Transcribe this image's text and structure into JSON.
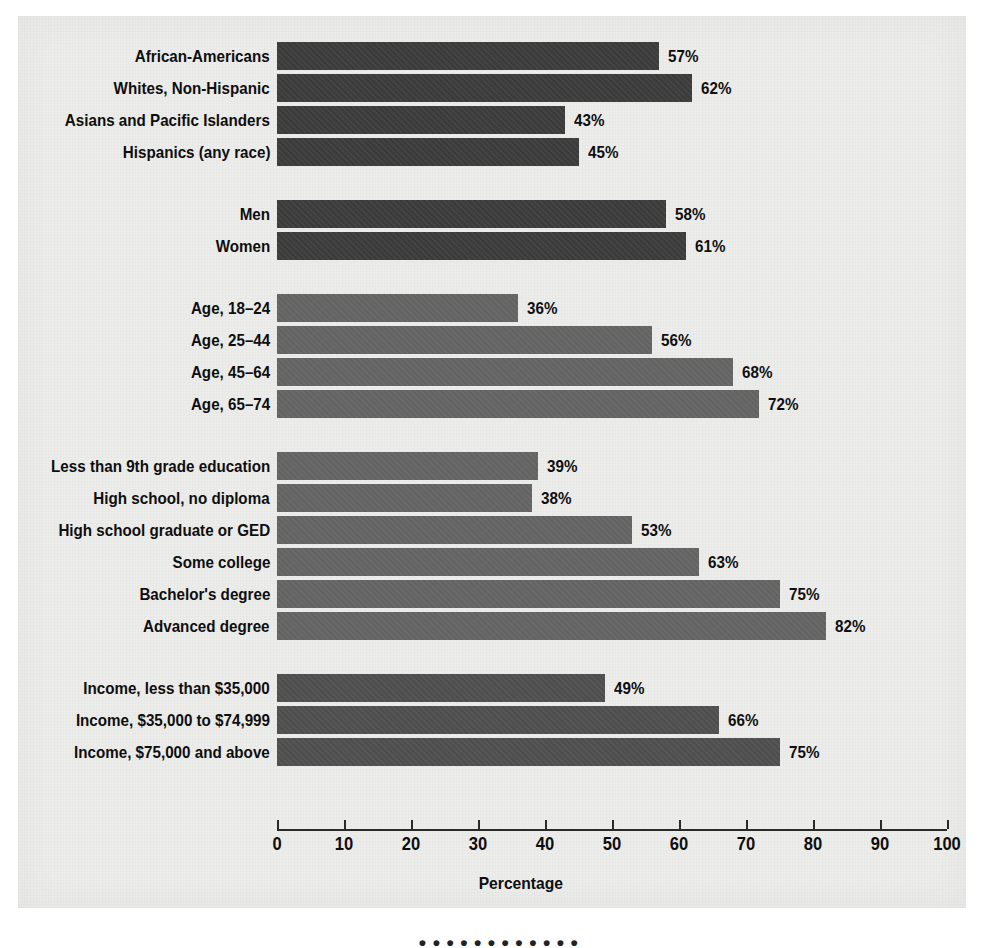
{
  "chart_data": {
    "type": "bar",
    "orientation": "horizontal",
    "title": "",
    "xlabel": "Percentage",
    "ylabel": "",
    "xlim": [
      0,
      100
    ],
    "xticks": [
      0,
      10,
      20,
      30,
      40,
      50,
      60,
      70,
      80,
      90,
      100
    ],
    "grid": false,
    "legend": false,
    "value_label_suffix": "%",
    "groups": [
      {
        "name": "race-ethnicity",
        "shade": "dark",
        "categories": [
          "African-Americans",
          "Whites, Non-Hispanic",
          "Asians and Pacific Islanders",
          "Hispanics (any race)"
        ],
        "values": [
          57,
          62,
          43,
          45
        ],
        "value_labels": [
          "57%",
          "62%",
          "43%",
          "45%"
        ]
      },
      {
        "name": "sex",
        "shade": "dark",
        "categories": [
          "Men",
          "Women"
        ],
        "values": [
          58,
          61
        ],
        "value_labels": [
          "58%",
          "61%"
        ]
      },
      {
        "name": "age",
        "shade": "mid",
        "categories": [
          "Age, 18–24",
          "Age, 25–44",
          "Age, 45–64",
          "Age, 65–74"
        ],
        "values": [
          36,
          56,
          68,
          72
        ],
        "value_labels": [
          "36%",
          "56%",
          "68%",
          "72%"
        ]
      },
      {
        "name": "education",
        "shade": "mid",
        "categories": [
          "Less than 9th grade education",
          "High school, no diploma",
          "High school graduate or GED",
          "Some college",
          "Bachelor's degree",
          "Advanced degree"
        ],
        "values": [
          39,
          38,
          53,
          63,
          75,
          82
        ],
        "value_labels": [
          "39%",
          "38%",
          "53%",
          "63%",
          "75%",
          "82%"
        ]
      },
      {
        "name": "income",
        "shade": "semi",
        "categories": [
          "Income, less than $35,000",
          "Income, $35,000 to $74,999",
          "Income, $75,000 and above"
        ],
        "values": [
          49,
          66,
          75
        ],
        "value_labels": [
          "49%",
          "66%",
          "75%"
        ]
      }
    ]
  },
  "colors": {
    "bar_dark": "#3b3b3b",
    "bar_mid": "#636363",
    "bar_semi": "#4e4e4e",
    "paper": "#ececeb",
    "text": "#0e0e0e"
  },
  "caption": "• • • •  • • • • • • • •"
}
